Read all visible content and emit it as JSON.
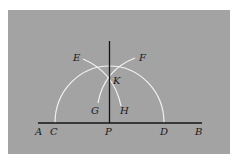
{
  "figure": {
    "colors": {
      "background": "#ffffff",
      "panel": "#a3a3a3",
      "line": "#141414",
      "arc": "#f2f2f2",
      "label": "#1a1a1a"
    },
    "labels": {
      "A": "A",
      "B": "B",
      "C": "C",
      "D": "D",
      "E": "E",
      "F": "F",
      "G": "G",
      "H": "H",
      "K": "K",
      "P": "P"
    }
  }
}
